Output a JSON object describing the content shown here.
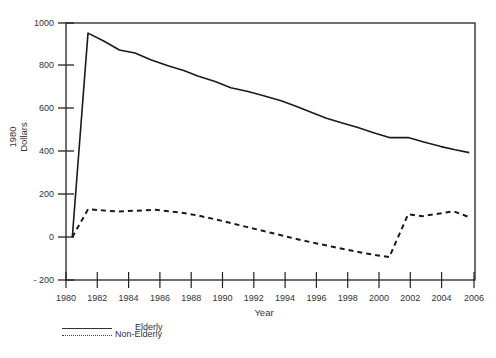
{
  "chart_data": {
    "type": "line",
    "title": "",
    "xlabel": "Year",
    "ylabel": "1980 Dollars",
    "xlim": [
      1980,
      2006
    ],
    "ylim": [
      -200,
      1000
    ],
    "grid": false,
    "legend_position": "bottom-left, below axes",
    "x_ticks": [
      1980,
      1982,
      1984,
      1986,
      1988,
      1990,
      1992,
      1994,
      1996,
      1998,
      2000,
      2002,
      2004,
      2006
    ],
    "y_ticks": [
      -200,
      0,
      200,
      400,
      600,
      800,
      1000
    ],
    "series": [
      {
        "name": "Elderly",
        "style": "solid",
        "x": [
          1980.4,
          1981.4,
          1982.4,
          1983.4,
          1984.4,
          1985.4,
          1986.5,
          1987.5,
          1988.4,
          1989.5,
          1990.5,
          1991.6,
          1992.6,
          1993.7,
          1994.7,
          1995.7,
          1996.6,
          1997.5,
          1998.6,
          1999.6,
          2000.6,
          2001.8,
          2002.8,
          2003.9,
          2004.8,
          2005.7
        ],
        "values": [
          0,
          953,
          916,
          874,
          860,
          828,
          800,
          778,
          753,
          727,
          698,
          680,
          660,
          637,
          610,
          581,
          555,
          535,
          512,
          488,
          465,
          465,
          445,
          423,
          408,
          395
        ]
      },
      {
        "name": "Non-Elderly",
        "style": "dashed",
        "x": [
          1980.4,
          1981.4,
          1983.3,
          1985.7,
          1987.3,
          1988.5,
          1990.0,
          1991.5,
          1993.2,
          1995.0,
          1997.0,
          1999.0,
          2000.6,
          2001.8,
          2002.7,
          2004.7,
          2005.7
        ],
        "values": [
          0,
          130,
          120,
          128,
          115,
          100,
          75,
          48,
          18,
          -14,
          -45,
          -75,
          -93,
          107,
          98,
          121,
          93
        ]
      }
    ]
  },
  "axes": {
    "y_tick_labels": [
      "1000",
      "800",
      "600",
      "400",
      "200",
      "0",
      "- 200"
    ],
    "x_tick_labels": [
      "1980",
      "1982",
      "1984",
      "1986",
      "1988",
      "1990",
      "1992",
      "1994",
      "1996",
      "1998",
      "2000",
      "2002",
      "2004",
      "2006"
    ],
    "ylabel_line1": "1980",
    "ylabel_line2": "Dollars",
    "xlabel": "Year"
  },
  "legend": {
    "items": [
      {
        "label": "Elderly",
        "style": "solid"
      },
      {
        "label": "Non-Elderly",
        "style": "dotted"
      }
    ]
  },
  "colors": {
    "line": "#1a1a1a",
    "axis": "#222222"
  }
}
